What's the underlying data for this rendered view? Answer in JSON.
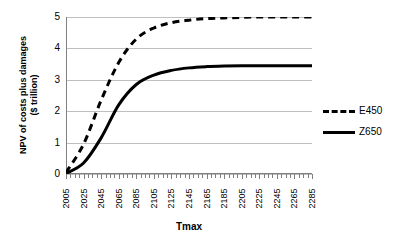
{
  "chart_data": {
    "type": "line",
    "title": "",
    "xlabel": "Tmax",
    "ylabel": "NPV of costs plus damages\n($ trillion)",
    "x": [
      2005,
      2025,
      2045,
      2065,
      2085,
      2105,
      2125,
      2145,
      2165,
      2185,
      2205,
      2225,
      2245,
      2265,
      2285
    ],
    "xticklabels": [
      "2005",
      "2025",
      "2045",
      "2065",
      "2085",
      "2105",
      "2125",
      "2145",
      "2165",
      "2185",
      "2205",
      "2225",
      "2245",
      "2265",
      "2285"
    ],
    "yticklabels": [
      "0",
      "1",
      "2",
      "3",
      "4",
      "5"
    ],
    "ylim": [
      0,
      5
    ],
    "yticks": [
      0,
      1,
      2,
      3,
      4,
      5
    ],
    "grid": "horizontal",
    "legend_position": "right",
    "series": [
      {
        "name": "E450",
        "style": "dashed",
        "color": "#000000",
        "values": [
          0.05,
          0.95,
          2.35,
          3.55,
          4.3,
          4.65,
          4.82,
          4.9,
          4.95,
          4.97,
          4.99,
          5.0,
          5.0,
          5.0,
          5.0
        ]
      },
      {
        "name": "Z650",
        "style": "solid",
        "color": "#000000",
        "values": [
          0.02,
          0.35,
          1.15,
          2.2,
          2.85,
          3.15,
          3.3,
          3.38,
          3.42,
          3.44,
          3.45,
          3.45,
          3.45,
          3.45,
          3.45
        ]
      }
    ]
  },
  "axes": {
    "y_title": "NPV of costs plus damages\n($ trillion)",
    "x_title": "Tmax"
  },
  "legend": {
    "items": [
      {
        "label": "E450",
        "style": "dashed"
      },
      {
        "label": "Z650",
        "style": "solid"
      }
    ]
  },
  "colors": {
    "gridline": "#bfbfbf",
    "axis": "#808080",
    "series": "#000000",
    "background": "#ffffff"
  }
}
